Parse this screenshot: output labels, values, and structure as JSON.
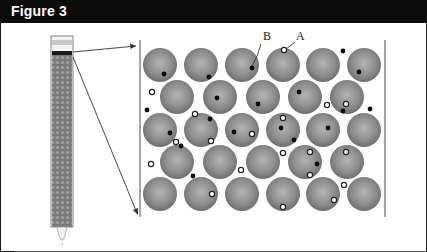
{
  "figure": {
    "title": "Figure 3"
  },
  "diagram": {
    "labels": [
      {
        "id": "B",
        "text": "B",
        "x": 263,
        "y": 40,
        "points_to": "particle inside bead (dark dot)",
        "pointer": {
          "x1": 261,
          "y1": 44,
          "x2": 252,
          "y2": 65
        }
      },
      {
        "id": "A",
        "text": "A",
        "x": 297,
        "y": 40,
        "points_to": "particle on bead surface (hollow ring)",
        "pointer": {
          "x1": 295,
          "y1": 42,
          "x2": 285,
          "y2": 50
        }
      }
    ],
    "column": {
      "description": "packed chromatography column with band at top and outlet tip at bottom"
    },
    "colors": {
      "bead_fill": "#8c8c8c",
      "bead_edge": "#6e6e6e",
      "bead_highlight": "#b4b4b4",
      "dark_particle": "#0a0a0a",
      "ring_particle_fill": "#ffffff",
      "ring_particle_stroke": "#222222",
      "header_bg": "#0b0b0b",
      "header_text": "#ffffff"
    },
    "bead_radius": 17,
    "bead_rows": [
      {
        "y": 65,
        "x": [
          160,
          201,
          242,
          283,
          323,
          364
        ]
      },
      {
        "y": 97,
        "x": [
          177,
          220,
          263,
          305,
          347
        ]
      },
      {
        "y": 130,
        "x": [
          160,
          201,
          242,
          283,
          323,
          364
        ]
      },
      {
        "y": 162,
        "x": [
          177,
          220,
          263,
          305,
          347
        ]
      },
      {
        "y": 194,
        "x": [
          160,
          201,
          242,
          283,
          323,
          364
        ]
      }
    ],
    "dark_particles": [
      [
        164,
        74
      ],
      [
        209,
        77
      ],
      [
        252,
        68
      ],
      [
        343,
        51
      ],
      [
        359,
        72
      ],
      [
        217,
        98
      ],
      [
        258,
        104
      ],
      [
        299,
        92
      ],
      [
        147,
        110
      ],
      [
        210,
        119
      ],
      [
        170,
        133
      ],
      [
        181,
        146
      ],
      [
        234,
        132
      ],
      [
        281,
        128
      ],
      [
        294,
        140
      ],
      [
        328,
        128
      ],
      [
        343,
        111
      ],
      [
        370,
        109
      ],
      [
        317,
        164
      ],
      [
        193,
        176
      ]
    ],
    "ring_particles": [
      [
        284,
        50
      ],
      [
        152,
        92
      ],
      [
        327,
        105
      ],
      [
        346,
        104
      ],
      [
        195,
        114
      ],
      [
        176,
        142
      ],
      [
        211,
        141
      ],
      [
        252,
        134
      ],
      [
        283,
        118
      ],
      [
        283,
        153
      ],
      [
        310,
        152
      ],
      [
        346,
        152
      ],
      [
        310,
        175
      ],
      [
        151,
        164
      ],
      [
        241,
        170
      ],
      [
        344,
        185
      ],
      [
        212,
        194
      ],
      [
        334,
        200
      ],
      [
        283,
        207
      ]
    ]
  }
}
